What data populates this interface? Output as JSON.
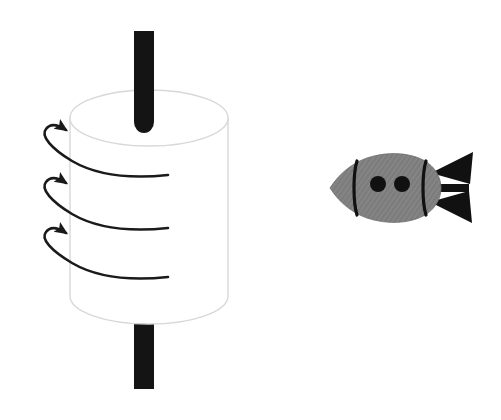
{
  "figure": {
    "background_color": "#ffffff",
    "width": 501,
    "height": 420
  },
  "colors": {
    "axle_black": "#141414",
    "cylinder_outline": "#d8d8d8",
    "cylinder_fill": "#ffffff",
    "arrow_stroke": "#1a1a1a",
    "rocket_body": "#808080",
    "rocket_detail_black": "#111111"
  },
  "objects": {
    "axle": {
      "name": "vertical-axle",
      "description": "Black vertical rod passing through the cylinder",
      "top_segment": {
        "x": 134,
        "y": 31,
        "width": 20,
        "height": 102,
        "rounded_bottom": true
      },
      "bottom_segment": {
        "x": 134,
        "y": 303,
        "width": 20,
        "height": 86
      }
    },
    "cylinder": {
      "name": "rotating-cylinder",
      "description": "White cylinder (drum) seen in perspective with elliptical top",
      "center_x": 149,
      "left_x": 70,
      "right_x": 228,
      "top_ellipse_center_y": 118,
      "bottom_ellipse_center_y": 296,
      "ellipse_rx": 79,
      "ellipse_ry": 28
    },
    "rotation_arrows": {
      "name": "rotation-arrows",
      "count": 3,
      "direction": "counterclockwise-viewed-from-above",
      "description": "Three curved arrows wrapping around the cylinder, arrowheads pointing right at the left side",
      "arrows": [
        {
          "index": 1,
          "tail_x": 168,
          "tail_y": 175,
          "head_x": 66,
          "head_y": 130
        },
        {
          "index": 2,
          "tail_x": 168,
          "tail_y": 228,
          "head_x": 66,
          "head_y": 183
        },
        {
          "index": 3,
          "tail_x": 168,
          "tail_y": 277,
          "head_x": 66,
          "head_y": 233
        }
      ]
    },
    "rocket": {
      "name": "rocket",
      "description": "Gray rocket / missile pointing to the left with two black porthole windows, two black band stripes and three black tail fins",
      "nose_x": 330,
      "tail_x": 470,
      "center_y": 188,
      "windows": [
        {
          "cx": 378,
          "cy": 184,
          "r": 8
        },
        {
          "cx": 402,
          "cy": 184,
          "r": 8
        }
      ],
      "bands": 2,
      "fins": 3
    }
  },
  "labels": {
    "none_visible": ""
  }
}
